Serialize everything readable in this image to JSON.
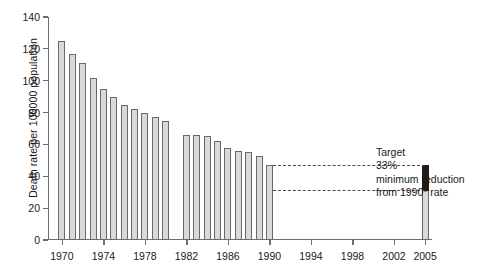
{
  "chart_data": {
    "type": "bar",
    "title": "",
    "xlabel": "",
    "ylabel": "Death rate per 100000 population",
    "ylim": [
      0,
      140
    ],
    "ytick_values": [
      0,
      20,
      40,
      60,
      80,
      100,
      120,
      140
    ],
    "ytick_labels": [
      "0",
      "20",
      "40",
      "60",
      "80",
      "100",
      "120",
      "140"
    ],
    "xlim": [
      1969,
      2006
    ],
    "xtick_values": [
      1970,
      1974,
      1978,
      1982,
      1986,
      1990,
      1994,
      1998,
      2002,
      2005
    ],
    "xtick_labels": [
      "1970",
      "1974",
      "1978",
      "1982",
      "1986",
      "1990",
      "1994",
      "1998",
      "2002",
      "2005"
    ],
    "grid": false,
    "legend": "none",
    "categories": [
      1970,
      1971,
      1972,
      1973,
      1974,
      1975,
      1976,
      1977,
      1978,
      1979,
      1980,
      1982,
      1983,
      1984,
      1985,
      1986,
      1987,
      1988,
      1989,
      1990
    ],
    "values": [
      125,
      117,
      111,
      102,
      95,
      90,
      85,
      82,
      79.5,
      77,
      74.5,
      66,
      66,
      65,
      62,
      58,
      56,
      55,
      53,
      47
    ],
    "missing_years": [
      1981
    ],
    "target_bar": {
      "year": 2005,
      "base": 0,
      "top": 47,
      "segment_top": 47,
      "segment_bottom": 31.5,
      "segment_color": "#231a16",
      "bar_color": "#d9d9d9"
    },
    "reference_lines": [
      {
        "value": 47,
        "style": "dashed",
        "from_year": 1990,
        "to_year": 2005
      },
      {
        "value": 31.5,
        "style": "dashed",
        "from_year": 1990,
        "to_year": 2005
      }
    ],
    "annotations": [
      {
        "text": "Target"
      },
      {
        "text": "33%"
      },
      {
        "text": "minimum reduction"
      },
      {
        "text": "from 1990* rate"
      }
    ]
  },
  "annotation": {
    "line1": "Target",
    "line2": "33%",
    "line3": "minimum reduction",
    "line4": "from 1990* rate"
  },
  "colors": {
    "bar_fill": "#d9d9d9",
    "bar_stroke": "#6a6a6a",
    "target_segment": "#231a16",
    "axis": "#6e6e6e",
    "text": "#1a1a1a"
  }
}
